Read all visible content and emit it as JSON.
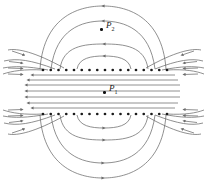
{
  "figure": {
    "name": "parallel-plate-capacitor-field-lines",
    "background_color": "#ffffff",
    "line_color": "#6b6b6b",
    "dot_color": "#1a1a1a",
    "width": 206,
    "height": 182
  },
  "points": [
    {
      "id": "P1",
      "label": "P",
      "subscript": "1",
      "x": 109,
      "y": 88,
      "dot_x": 103,
      "dot_y": 91
    },
    {
      "id": "P2",
      "label": "P",
      "subscript": "2",
      "x": 106,
      "y": 24,
      "dot_x": 100,
      "dot_y": 28
    }
  ],
  "plates": [
    {
      "name": "top-plate",
      "y": 70,
      "x_start": 43,
      "x_end": 167,
      "dot_count": 17,
      "charge_sign": "+"
    },
    {
      "name": "bottom-plate",
      "y": 114,
      "x_start": 43,
      "x_end": 167,
      "dot_count": 17,
      "charge_sign": "-"
    }
  ],
  "chart_data": {
    "type": "line",
    "title": "",
    "xlabel": "",
    "ylabel": "",
    "series": [
      {
        "name": "interior-field-line",
        "values": [],
        "direction": "leftward"
      },
      {
        "name": "fringing-arc",
        "values": [],
        "direction": "clockwise"
      }
    ]
  }
}
